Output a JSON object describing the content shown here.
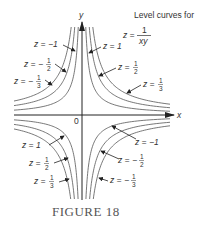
{
  "figure": {
    "caption": "FIGURE 18",
    "title_line1": "Level curves for",
    "title_eq_lhs": "z =",
    "title_eq_num": "1",
    "title_eq_den": "xy",
    "axis_x_label": "x",
    "axis_y_label": "y",
    "origin_label": "0"
  },
  "labels": {
    "q2": [
      {
        "lhs": "z = −1",
        "frac": null
      },
      {
        "lhs": "z = −",
        "num": "1",
        "den": "2"
      },
      {
        "lhs": "z = −",
        "num": "1",
        "den": "3"
      }
    ],
    "q1": [
      {
        "lhs": "z = 1",
        "frac": null
      },
      {
        "lhs": "z =",
        "num": "1",
        "den": "2"
      },
      {
        "lhs": "z =",
        "num": "1",
        "den": "3"
      }
    ],
    "q3": [
      {
        "lhs": "z = 1",
        "frac": null
      },
      {
        "lhs": "z =",
        "num": "1",
        "den": "2"
      },
      {
        "lhs": "z =",
        "num": "1",
        "den": "3"
      }
    ],
    "q4": [
      {
        "lhs": "z = −1",
        "frac": null
      },
      {
        "lhs": "z = −",
        "num": "1",
        "den": "2"
      },
      {
        "lhs": "z = −",
        "num": "1",
        "den": "3"
      }
    ]
  },
  "chart_data": {
    "type": "line",
    "xlabel": "x",
    "ylabel": "y",
    "series": [
      {
        "name": "z = 1",
        "equation": "xy = 1",
        "quadrants": [
          "I",
          "III"
        ]
      },
      {
        "name": "z = 1/2",
        "equation": "xy = 2",
        "quadrants": [
          "I",
          "III"
        ]
      },
      {
        "name": "z = 1/3",
        "equation": "xy = 3",
        "quadrants": [
          "I",
          "III"
        ]
      },
      {
        "name": "z = -1",
        "equation": "xy = -1",
        "quadrants": [
          "II",
          "IV"
        ]
      },
      {
        "name": "z = -1/2",
        "equation": "xy = -2",
        "quadrants": [
          "II",
          "IV"
        ]
      },
      {
        "name": "z = -1/3",
        "equation": "xy = -3",
        "quadrants": [
          "II",
          "IV"
        ]
      }
    ],
    "annotations": [
      "0"
    ],
    "grid": false,
    "legend": "inline labels with arrows"
  }
}
